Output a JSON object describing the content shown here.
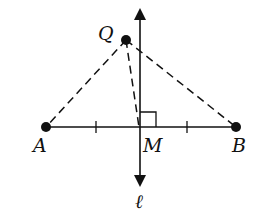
{
  "diagram": {
    "type": "perpendicular-bisector",
    "points": {
      "A": {
        "label": "A",
        "x": 46,
        "y": 127
      },
      "B": {
        "label": "B",
        "x": 236,
        "y": 127
      },
      "M": {
        "label": "M",
        "x": 140,
        "y": 127
      },
      "Q": {
        "label": "Q",
        "x": 126,
        "y": 40
      }
    },
    "line": {
      "label": "ℓ"
    },
    "segments": [
      "AB"
    ],
    "dashed_segments": [
      "QA",
      "QM",
      "QB"
    ],
    "marks": [
      "tick AM",
      "tick MB",
      "right angle at M"
    ],
    "colors": {
      "stroke": "#111111",
      "background": "#ffffff"
    }
  }
}
